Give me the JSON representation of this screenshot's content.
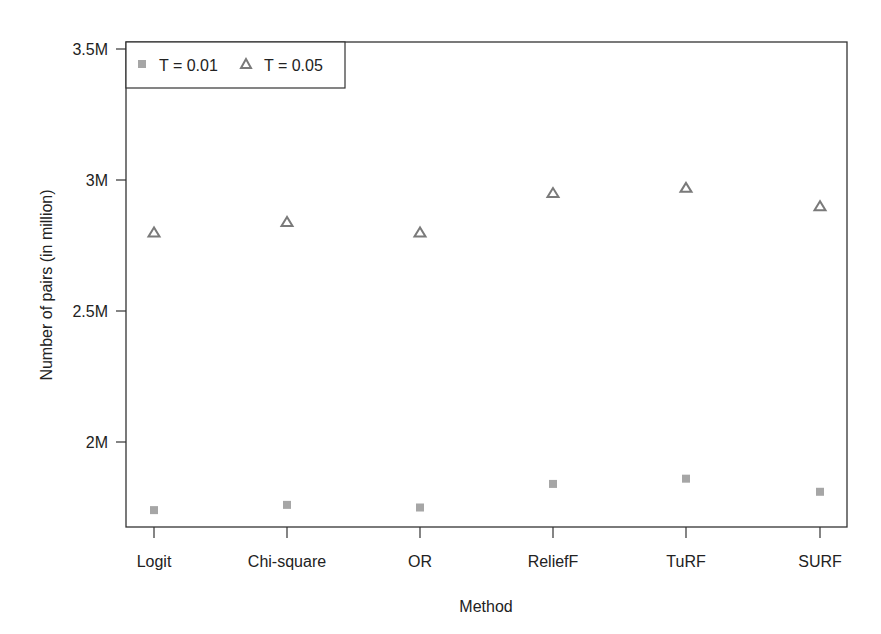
{
  "chart_data": {
    "type": "scatter",
    "title": "",
    "xlabel": "Method",
    "ylabel": "Number of pairs (in million)",
    "categories": [
      "Logit",
      "Chi-square",
      "OR",
      "ReliefF",
      "TuRF",
      "SURF"
    ],
    "yticks": [
      {
        "value": 2.0,
        "label": "2M"
      },
      {
        "value": 2.5,
        "label": "2.5M"
      },
      {
        "value": 3.0,
        "label": "3M"
      },
      {
        "value": 3.5,
        "label": "3.5M"
      }
    ],
    "ylim": [
      1.67,
      3.53
    ],
    "grid": false,
    "legend_position": "top-left",
    "series": [
      {
        "name": "T = 0.01",
        "marker": "filled-square",
        "color": "#a6a6a6",
        "values": [
          1.74,
          1.76,
          1.75,
          1.84,
          1.86,
          1.81
        ]
      },
      {
        "name": "T = 0.05",
        "marker": "open-triangle",
        "color": "#7a7a7a",
        "values": [
          2.8,
          2.84,
          2.8,
          2.95,
          2.97,
          2.9
        ]
      }
    ]
  }
}
